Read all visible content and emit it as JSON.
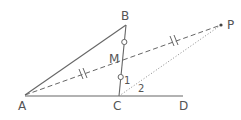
{
  "diagram": {
    "points": {
      "A": {
        "label": "A",
        "x": 25,
        "y": 95
      },
      "B": {
        "label": "B",
        "x": 126,
        "y": 25
      },
      "C": {
        "label": "C",
        "x": 119,
        "y": 96
      },
      "D": {
        "label": "D",
        "x": 183,
        "y": 96
      },
      "M": {
        "label": "M",
        "x": 122,
        "y": 60
      },
      "P": {
        "label": "P",
        "x": 221,
        "y": 25
      }
    },
    "angles": {
      "angle1": "1",
      "angle2": "2"
    },
    "segments": [
      {
        "from": "A",
        "to": "B",
        "style": "solid"
      },
      {
        "from": "B",
        "to": "C",
        "style": "solid"
      },
      {
        "from": "A",
        "to": "D",
        "style": "solid"
      },
      {
        "from": "A",
        "to": "P",
        "style": "dashed"
      },
      {
        "from": "C",
        "to": "P",
        "style": "dotted"
      }
    ],
    "marks": {
      "equal_BM_MC": "circle",
      "equal_AM_MP": "double-tick"
    },
    "colors": {
      "line": "#666666",
      "text": "#555555"
    }
  }
}
